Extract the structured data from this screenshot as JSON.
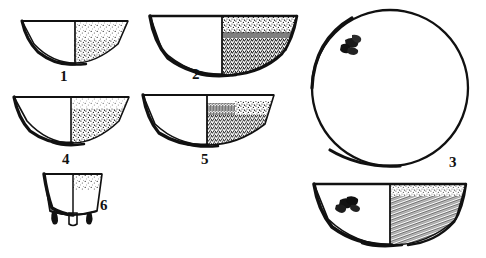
{
  "plate": {
    "title": "Archaeological vessel profile plate",
    "description": "Line drawings of six ceramic vessels: half-section profiles with stippled fills, one plan view with decorative motif",
    "background_color": "#ffffff",
    "ink_color": "#111111",
    "width": 486,
    "height": 258
  },
  "vessels": [
    {
      "id": "1",
      "label": "1",
      "type": "bowl-profile-half-section",
      "view": "profile",
      "shape": "shallow hemispherical bowl with everted rim",
      "fill": "light stipple",
      "label_position": "below-center"
    },
    {
      "id": "2",
      "label": "2",
      "type": "bowl-profile-half-section",
      "view": "profile",
      "shape": "deep hemispherical bowl with flaring rim",
      "fill": "dense stipple with dark band",
      "label_position": "below-center"
    },
    {
      "id": "3",
      "label": "3",
      "type": "dish-plan-view",
      "view": "plan",
      "shape": "large circular open dish",
      "fill": "plain with stamped motif",
      "label_position": "lower-right"
    },
    {
      "id": "4",
      "label": "4",
      "type": "bowl-profile-half-section",
      "view": "profile",
      "shape": "shallow wide bowl",
      "fill": "light stipple",
      "label_position": "below-center"
    },
    {
      "id": "5",
      "label": "5",
      "type": "bowl-profile-half-section",
      "view": "profile",
      "shape": "shallow bowl with straight rim",
      "fill": "comb-hatch and stipple",
      "label_position": "below-center"
    },
    {
      "id": "6",
      "label": "6",
      "type": "tripod-vessel-profile",
      "view": "profile",
      "shape": "bucket-shaped vessel with concave sides on three short feet",
      "fill": "light stipple",
      "label_position": "right-side"
    },
    {
      "id": "3-section",
      "label": "",
      "type": "dish-profile-half-section",
      "view": "profile",
      "shape": "deep dish section with interior stamped motif",
      "fill": "dense hatch",
      "label_position": "none"
    }
  ],
  "motifs": [
    {
      "name": "stamped-motif-plan",
      "on_vessel": "3",
      "description": "small dark claw-like stamped decoration near upper-left rim"
    },
    {
      "name": "stamped-motif-section",
      "on_vessel": "3-section",
      "description": "small dark claw-like stamped decoration on interior left wall"
    }
  ]
}
